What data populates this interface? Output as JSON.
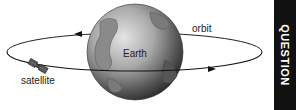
{
  "labels": {
    "earth": "Earth",
    "orbit": "orbit",
    "satellite": "satellite"
  },
  "sidebar": {
    "label": "QUESTION"
  },
  "colors": {
    "sidebar_bg": "#111111",
    "sidebar_text": "#ffffff",
    "globe_dark": "#3a3a3a",
    "globe_light": "#cfcfcf"
  }
}
